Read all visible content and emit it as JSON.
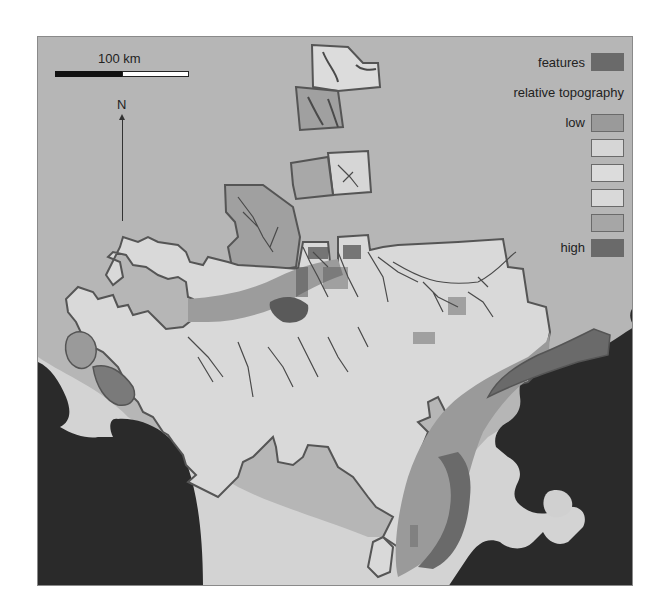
{
  "map": {
    "scale_bar": {
      "label": "100 km"
    },
    "north_arrow": {
      "label": "N"
    },
    "legend": {
      "features": {
        "label": "features",
        "color": "#6a6a6a"
      },
      "relative_topography": {
        "title": "relative topography",
        "classes": [
          {
            "label": "low",
            "color": "#9a9a9a"
          },
          {
            "label": "",
            "color": "#d6d6d6"
          },
          {
            "label": "",
            "color": "#dcdcdc"
          },
          {
            "label": "",
            "color": "#d9d9d9"
          },
          {
            "label": "",
            "color": "#a6a6a6"
          },
          {
            "label": "high",
            "color": "#6a6a6a"
          }
        ]
      }
    },
    "colors": {
      "background": "#b6b6b6",
      "land_light": "#d8d8d8",
      "water": "#2a2a2a",
      "outline": "#555555"
    }
  }
}
